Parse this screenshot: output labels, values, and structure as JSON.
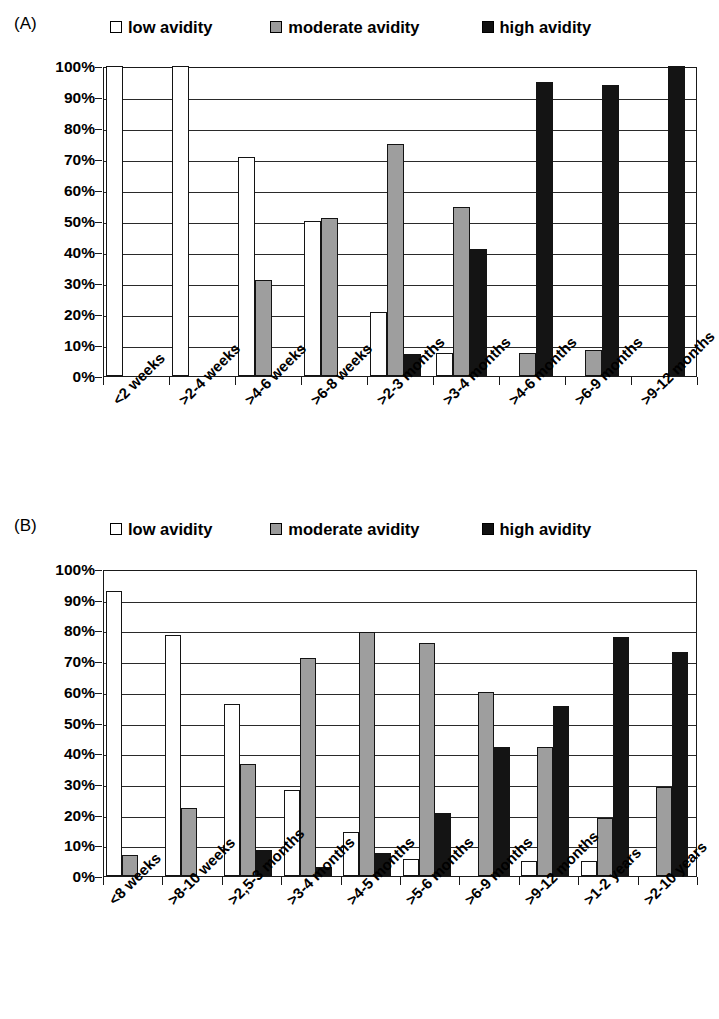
{
  "panels": [
    {
      "tag": "(A)",
      "legend": [
        {
          "label": "low avidity",
          "swatch": "legend-swatch-low",
          "color": "#ffffff"
        },
        {
          "label": "moderate avidity",
          "swatch": "legend-swatch-moderate",
          "color": "#9e9e9e"
        },
        {
          "label": "high avidity",
          "swatch": "legend-swatch-high",
          "color": "#141414"
        }
      ],
      "ytick_labels": [
        "100%",
        "90%",
        "80%",
        "70%",
        "60%",
        "50%",
        "40%",
        "30%",
        "20%",
        "10%",
        "0%"
      ]
    },
    {
      "tag": "(B)",
      "legend": [
        {
          "label": "low avidity",
          "swatch": "legend-swatch-low",
          "color": "#ffffff"
        },
        {
          "label": "moderate avidity",
          "swatch": "legend-swatch-moderate",
          "color": "#9e9e9e"
        },
        {
          "label": "high avidity",
          "swatch": "legend-swatch-high",
          "color": "#141414"
        }
      ],
      "ytick_labels": [
        "100%",
        "90%",
        "80%",
        "70%",
        "60%",
        "50%",
        "40%",
        "30%",
        "20%",
        "10%",
        "0%"
      ]
    }
  ],
  "chart_data": [
    {
      "type": "bar",
      "title": "(A)",
      "xlabel": "",
      "ylabel": "",
      "ylim": [
        0,
        100
      ],
      "yticks": [
        0,
        10,
        20,
        30,
        40,
        50,
        60,
        70,
        80,
        90,
        100
      ],
      "ytick_labels": [
        "0%",
        "10%",
        "20%",
        "30%",
        "40%",
        "50%",
        "60%",
        "70%",
        "80%",
        "90%",
        "100%"
      ],
      "grid": true,
      "legend_position": "top",
      "categories": [
        "<2 weeks",
        ">2-4 weeks",
        ">4-6 weeks",
        ">6-8 weeks",
        ">2-3 months",
        ">3-4 months",
        ">4-6 months",
        ">6-9 months",
        ">9-12 months"
      ],
      "series": [
        {
          "name": "low avidity",
          "color": "#ffffff",
          "values": [
            100,
            100,
            70.5,
            50,
            20.5,
            7.5,
            0,
            0,
            0
          ]
        },
        {
          "name": "moderate avidity",
          "color": "#9e9e9e",
          "values": [
            0,
            0,
            31,
            51,
            75,
            54.5,
            7.5,
            8.5,
            0
          ]
        },
        {
          "name": "high avidity",
          "color": "#141414",
          "values": [
            0,
            0,
            0,
            0,
            7,
            41,
            95,
            94,
            100
          ]
        }
      ]
    },
    {
      "type": "bar",
      "title": "(B)",
      "xlabel": "",
      "ylabel": "",
      "ylim": [
        0,
        100
      ],
      "yticks": [
        0,
        10,
        20,
        30,
        40,
        50,
        60,
        70,
        80,
        90,
        100
      ],
      "ytick_labels": [
        "0%",
        "10%",
        "20%",
        "30%",
        "40%",
        "50%",
        "60%",
        "70%",
        "80%",
        "90%",
        "100%"
      ],
      "grid": true,
      "legend_position": "top",
      "categories": [
        "<8 weeks",
        ">8-10 weeks",
        ">2,5-3 months",
        ">3-4 months",
        ">4-5 months",
        ">5-6 months",
        ">6-9 months",
        ">9-12 months",
        ">1-2 years",
        ">2-10 years"
      ],
      "series": [
        {
          "name": "low avidity",
          "color": "#ffffff",
          "values": [
            93,
            78.5,
            56,
            28,
            14.5,
            5.5,
            0,
            5,
            5,
            0
          ]
        },
        {
          "name": "moderate avidity",
          "color": "#9e9e9e",
          "values": [
            7,
            22,
            36.5,
            71,
            79.5,
            76,
            60,
            42,
            19,
            29
          ]
        },
        {
          "name": "high avidity",
          "color": "#141414",
          "values": [
            0,
            0,
            8.5,
            3,
            7.5,
            20.5,
            42,
            55.5,
            78,
            73
          ]
        }
      ]
    }
  ]
}
